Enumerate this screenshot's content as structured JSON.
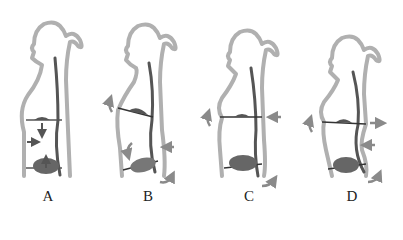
{
  "figures": [
    {
      "id": "A",
      "label": "A"
    },
    {
      "id": "B",
      "label": "B"
    },
    {
      "id": "C",
      "label": "C"
    },
    {
      "id": "D",
      "label": "D"
    }
  ],
  "colors": {
    "outline": "#b0b0b0",
    "spine": "#555555",
    "diaphragm": "#666666",
    "arrow": "#8a8a8a",
    "label": "#222222",
    "background": "#ffffff"
  }
}
